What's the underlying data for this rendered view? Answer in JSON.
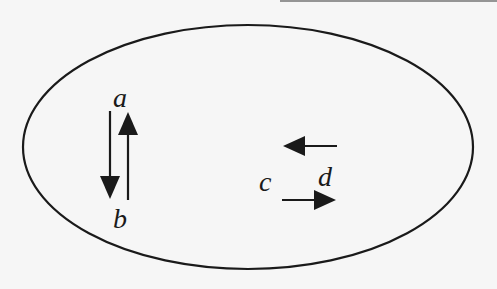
{
  "diagram": {
    "type": "ellipse-with-arrows",
    "colors": {
      "stroke": "#1a1a1a",
      "background": "#f6f6f6"
    },
    "ellipse": {
      "cx": 248,
      "cy": 147,
      "rx": 225,
      "ry": 122
    },
    "labels": {
      "a": "a",
      "b": "b",
      "c": "c",
      "d": "d"
    },
    "arrows": [
      {
        "id": "a-to-b",
        "direction": "down",
        "description": "arrow pointing down from a toward b"
      },
      {
        "id": "b-to-a",
        "direction": "up",
        "description": "arrow pointing up from b toward a"
      },
      {
        "id": "upper-left",
        "direction": "left",
        "description": "upper arrow near c/d pointing left"
      },
      {
        "id": "lower-right",
        "direction": "right",
        "description": "lower arrow near c/d pointing right"
      }
    ]
  }
}
